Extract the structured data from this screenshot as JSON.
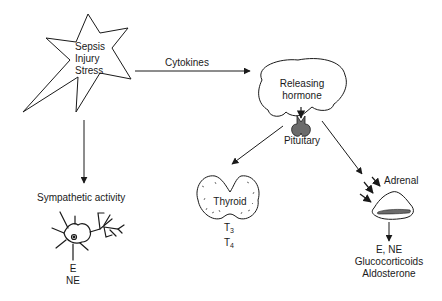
{
  "diagram": {
    "stressor": {
      "lines": [
        "Sepsis",
        "Injury",
        "Stress"
      ]
    },
    "cytokines_label": "Cytokines",
    "hypothalamus": {
      "lines": [
        "Releasing",
        "hormone"
      ]
    },
    "pituitary_label": "Pituitary",
    "sympathetic": {
      "label": "Sympathetic activity",
      "outputs": [
        "E",
        "NE"
      ]
    },
    "thyroid": {
      "label": "Thyroid",
      "outputs": [
        {
          "base": "T",
          "sub": "3"
        },
        {
          "base": "T",
          "sub": "4"
        }
      ]
    },
    "adrenal": {
      "label": "Adrenal",
      "outputs": [
        "E, NE",
        "Glucocorticoids",
        "Aldosterone"
      ]
    },
    "colors": {
      "line": "#1a1a1a",
      "pituitary_fill": "#6b6b6b",
      "background": "#ffffff"
    }
  }
}
